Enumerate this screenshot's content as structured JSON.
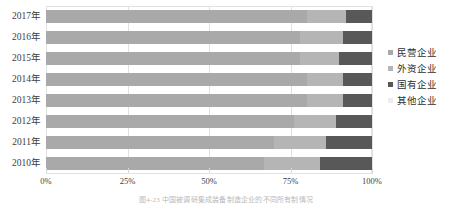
{
  "chart_data": {
    "type": "bar",
    "subtype": "stacked-horizontal-100-percent",
    "title": "",
    "caption": "图4-23  中国被调研集成装备制造企业的不同所有制情况",
    "xlabel": "",
    "ylabel": "",
    "xlim": [
      0,
      100
    ],
    "xticks": [
      0,
      25,
      50,
      75,
      100
    ],
    "xticklabels": [
      "0%",
      "25%",
      "50%",
      "75%",
      "100%"
    ],
    "grid": true,
    "legend_position": "right",
    "categories": [
      "2017年",
      "2016年",
      "2015年",
      "2014年",
      "2013年",
      "2012年",
      "2011年",
      "2010年"
    ],
    "series": [
      {
        "name": "民营企业",
        "color": "#a9a9a9",
        "values": [
          80,
          78,
          78,
          80,
          80,
          76,
          70,
          67
        ]
      },
      {
        "name": "外资企业",
        "color": "#b5b5b5",
        "values": [
          12,
          13,
          12,
          11,
          11,
          13,
          16,
          17
        ]
      },
      {
        "name": "国有企业",
        "color": "#585858",
        "values": [
          8,
          9,
          10,
          9,
          9,
          11,
          14,
          16
        ]
      },
      {
        "name": "其他企业",
        "color": "#ededed",
        "values": [
          0,
          0,
          0,
          0,
          0,
          0,
          0,
          0
        ]
      }
    ]
  },
  "legend": {
    "items": [
      {
        "label": "民营企业",
        "color": "#a9a9a9"
      },
      {
        "label": "外资企业",
        "color": "#b5b5b5"
      },
      {
        "label": "国有企业",
        "color": "#585858"
      },
      {
        "label": "其他企业",
        "color": "#ededed"
      }
    ]
  },
  "axes": {
    "y_categories": [
      "2017年",
      "2016年",
      "2015年",
      "2014年",
      "2013年",
      "2012年",
      "2011年",
      "2010年"
    ],
    "x_ticklabels": [
      "0%",
      "25%",
      "50%",
      "75%",
      "100%"
    ]
  },
  "caption": {
    "text": "图4-23  中国被调研集成装备制造企业的不同所有制情况"
  },
  "colors": {
    "private": "#a9a9a9",
    "foreign": "#b5b5b5",
    "state": "#585858",
    "other": "#ededed",
    "grid": "#e0e0e0",
    "text": "#3d3d3d"
  }
}
